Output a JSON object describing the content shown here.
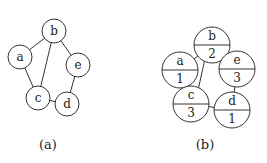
{
  "figure_a": {
    "caption": "(a)",
    "nodes": [
      {
        "id": "a",
        "label": "a"
      },
      {
        "id": "b",
        "label": "b"
      },
      {
        "id": "c",
        "label": "c"
      },
      {
        "id": "d",
        "label": "d"
      },
      {
        "id": "e",
        "label": "e"
      }
    ],
    "edges": [
      [
        "a",
        "b"
      ],
      [
        "a",
        "c"
      ],
      [
        "b",
        "c"
      ],
      [
        "b",
        "e"
      ],
      [
        "e",
        "d"
      ],
      [
        "c",
        "d"
      ]
    ]
  },
  "figure_b": {
    "caption": "(b)",
    "nodes": [
      {
        "id": "a",
        "label": "a",
        "value": "1"
      },
      {
        "id": "b",
        "label": "b",
        "value": "2"
      },
      {
        "id": "c",
        "label": "c",
        "value": "3"
      },
      {
        "id": "d",
        "label": "d",
        "value": "1"
      },
      {
        "id": "e",
        "label": "e",
        "value": "3"
      }
    ],
    "edges": [
      [
        "a",
        "b"
      ],
      [
        "a",
        "c"
      ],
      [
        "b",
        "c"
      ],
      [
        "b",
        "e"
      ],
      [
        "e",
        "d"
      ],
      [
        "c",
        "d"
      ]
    ]
  }
}
